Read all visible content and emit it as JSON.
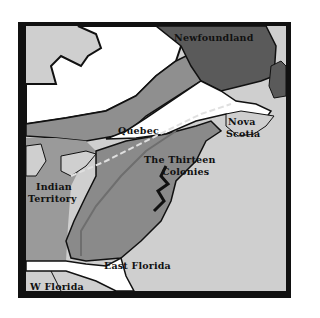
{
  "map": {
    "colors": {
      "frame": "#111111",
      "ocean_land_light": "#cfcfcf",
      "quebec_region": "#ffffff",
      "canada_mid": "#8f8f8f",
      "newfoundland": "#5a5a5a",
      "colonies": "#8a8a8a",
      "indian_territory": "#9a9a9a",
      "florida": "#ffffff"
    },
    "labels": {
      "newfoundland": "Newfoundland",
      "quebec": "Quebec",
      "nova": "Nova",
      "scotia": "Scotia",
      "thirteen": "The Thirteen",
      "colonies": "Colonies",
      "indian": "Indian",
      "territory": "Territory",
      "east_florida": "East Florida",
      "w_florida": "W Florida"
    }
  }
}
